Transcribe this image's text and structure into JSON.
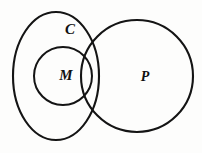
{
  "diagram": {
    "kind": "venn-diagram",
    "background_color": "#fdfdfc",
    "stroke_color": "#141414",
    "sets": [
      {
        "id": "C",
        "label": "C",
        "shape": "ellipse",
        "cx": 56,
        "cy": 76,
        "rx": 43,
        "ry": 64,
        "label_x": 70,
        "label_y": 31
      },
      {
        "id": "M",
        "label": "M",
        "shape": "circle",
        "cx": 63,
        "cy": 76,
        "rx": 29,
        "ry": 29,
        "label_x": 66,
        "label_y": 77
      },
      {
        "id": "P",
        "label": "P",
        "shape": "circle",
        "cx": 137,
        "cy": 76,
        "rx": 56,
        "ry": 56,
        "label_x": 145,
        "label_y": 78
      }
    ]
  }
}
